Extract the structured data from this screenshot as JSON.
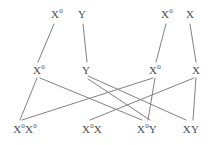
{
  "diagram": {
    "stroke_color": "#808080",
    "text_color": "#4a4a4a",
    "background_color": "#ffffff",
    "stroke_width": 1,
    "nodes": [
      {
        "id": "p1-left",
        "label_html": "X<sup>0</sup>",
        "label_text": "X0",
        "row": "parents",
        "x": 57,
        "y": 14
      },
      {
        "id": "p1-right",
        "label_html": "Y",
        "label_text": "Y",
        "row": "parents",
        "x": 82,
        "y": 14
      },
      {
        "id": "p2-left",
        "label_html": "X<sup>0</sup>",
        "label_text": "X0",
        "row": "parents",
        "x": 167,
        "y": 14
      },
      {
        "id": "p2-right",
        "label_html": "X",
        "label_text": "X",
        "row": "parents",
        "x": 190,
        "y": 14
      },
      {
        "id": "g1",
        "label_html": "X<sup>0</sup>",
        "label_text": "X0",
        "row": "gametes",
        "x": 39,
        "y": 70
      },
      {
        "id": "g2",
        "label_html": "Y",
        "label_text": "Y",
        "row": "gametes",
        "x": 86,
        "y": 70
      },
      {
        "id": "g3",
        "label_html": "X<sup>0</sup>",
        "label_text": "X0",
        "row": "gametes",
        "x": 155,
        "y": 70
      },
      {
        "id": "g4",
        "label_html": "X",
        "label_text": "X",
        "row": "gametes",
        "x": 196,
        "y": 70
      },
      {
        "id": "o1",
        "label_html": "X<sup>0</sup>X<sup>0</sup>",
        "label_text": "X0X0",
        "row": "offspring",
        "x": 25,
        "y": 129
      },
      {
        "id": "o2",
        "label_html": "X<sup>0</sup>X",
        "label_text": "X0X",
        "row": "offspring",
        "x": 92,
        "y": 129
      },
      {
        "id": "o3",
        "label_html": "X<sup>0</sup>Y",
        "label_text": "X0Y",
        "row": "offspring",
        "x": 147,
        "y": 129
      },
      {
        "id": "o4",
        "label_html": "XY",
        "label_text": "XY",
        "row": "offspring",
        "x": 191,
        "y": 129
      }
    ],
    "edges": [
      {
        "from": "p1-left",
        "to": "g1",
        "x1": 54,
        "y1": 24,
        "x2": 38,
        "y2": 62
      },
      {
        "from": "p1-right",
        "to": "g2",
        "x1": 83,
        "y1": 24,
        "x2": 87,
        "y2": 62
      },
      {
        "from": "p2-left",
        "to": "g3",
        "x1": 166,
        "y1": 24,
        "x2": 156,
        "y2": 62
      },
      {
        "from": "p2-right",
        "to": "g4",
        "x1": 190,
        "y1": 24,
        "x2": 196,
        "y2": 62
      },
      {
        "from": "g1",
        "to": "o1",
        "x1": 37,
        "y1": 78,
        "x2": 20,
        "y2": 120
      },
      {
        "from": "g1",
        "to": "o2",
        "x1": 40,
        "y1": 78,
        "x2": 142,
        "y2": 120
      },
      {
        "from": "g2",
        "to": "o3",
        "x1": 88,
        "y1": 76,
        "x2": 186,
        "y2": 120
      },
      {
        "from": "g2",
        "to": "o4",
        "x1": 88,
        "y1": 79,
        "x2": 150,
        "y2": 120
      },
      {
        "from": "g3",
        "to": "o3",
        "x1": 155,
        "y1": 78,
        "x2": 148,
        "y2": 120
      },
      {
        "from": "g3",
        "to": "o1",
        "x1": 153,
        "y1": 78,
        "x2": 22,
        "y2": 120
      },
      {
        "from": "g4",
        "to": "o4",
        "x1": 196,
        "y1": 78,
        "x2": 193,
        "y2": 120
      },
      {
        "from": "g4",
        "to": "o2",
        "x1": 194,
        "y1": 78,
        "x2": 90,
        "y2": 120
      }
    ]
  }
}
